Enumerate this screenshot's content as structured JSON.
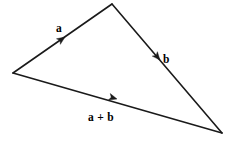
{
  "figure": {
    "name": "vector-addition-triangle",
    "background_color": "#ffffff",
    "stroke_color": "#1a1a1a",
    "text_color": "#000000",
    "width": 233,
    "height": 141
  },
  "vertices": {
    "tail": {
      "label": "tail",
      "x": 13,
      "y": 73
    },
    "apex": {
      "label": "apex",
      "x": 112,
      "y": 4
    },
    "head": {
      "label": "head",
      "x": 222,
      "y": 133
    }
  },
  "vectors": [
    {
      "id": "a",
      "label": "a",
      "from": "tail",
      "to": "apex",
      "label_x": 56,
      "label_y": 32,
      "arrow_x": 65,
      "arrow_y": 37,
      "arrow_angle_deg": -34.9
    },
    {
      "id": "b",
      "label": "b",
      "from": "apex",
      "to": "head",
      "label_x": 163,
      "label_y": 63,
      "arrow_x": 160,
      "arrow_y": 60,
      "arrow_angle_deg": 49.6
    },
    {
      "id": "a-plus-b",
      "label": "a + b",
      "from": "tail",
      "to": "head",
      "label_x": 88,
      "label_y": 121,
      "arrow_x": 117,
      "arrow_y": 99,
      "arrow_angle_deg": 16.0
    }
  ]
}
